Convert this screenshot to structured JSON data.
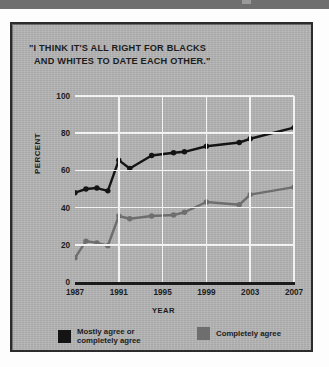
{
  "panel": {
    "title_line1": "\"I THINK IT'S ALL RIGHT FOR BLACKS",
    "title_line2": "AND WHITES TO DATE EACH OTHER.\""
  },
  "legend": {
    "items": [
      {
        "label_line1": "Mostly agree or",
        "label_line2": "completely agree",
        "color": "#141414"
      },
      {
        "label_line1": "Completely agree",
        "label_line2": "",
        "color": "#6e6e6e"
      }
    ]
  },
  "colors": {
    "series_dark": "#141414",
    "series_gray": "#6e6e6e",
    "gridline": "#f2f2f2",
    "axis": "#1a1a1a",
    "panel_background": "#b4b4b4",
    "panel_border": "#2c2c2c"
  },
  "chart_data": {
    "type": "line",
    "title": "\"I THINK IT'S ALL RIGHT FOR BLACKS AND WHITES TO DATE EACH OTHER.\"",
    "xlabel": "YEAR",
    "ylabel": "PERCENT",
    "xlim": [
      1987,
      2007
    ],
    "ylim": [
      0,
      100
    ],
    "ytick_values": [
      0,
      20,
      40,
      60,
      80,
      100
    ],
    "ytick_labels": [
      "0",
      "20",
      "40",
      "60",
      "80",
      "100"
    ],
    "xtick_values": [
      1987,
      1991,
      1995,
      1999,
      2003,
      2007
    ],
    "xtick_labels": [
      "1987",
      "1991",
      "1995",
      "1999",
      "2003",
      "2007"
    ],
    "grid": true,
    "grid_color": "#f2f2f2",
    "legend_position": "bottom",
    "x": [
      1987,
      1988,
      1989,
      1990,
      1991,
      1992,
      1994,
      1996,
      1997,
      1999,
      2002,
      2003,
      2007
    ],
    "series": [
      {
        "name": "Mostly agree or completely agree",
        "color": "#141414",
        "values": [
          48,
          50,
          50.5,
          49,
          65.5,
          61,
          68,
          69.5,
          70,
          73,
          75,
          77,
          83
        ]
      },
      {
        "name": "Completely agree",
        "color": "#6e6e6e",
        "values": [
          13,
          22,
          21,
          19.5,
          35.5,
          34,
          35.5,
          36,
          37.5,
          43,
          41.5,
          47,
          51
        ]
      }
    ]
  }
}
